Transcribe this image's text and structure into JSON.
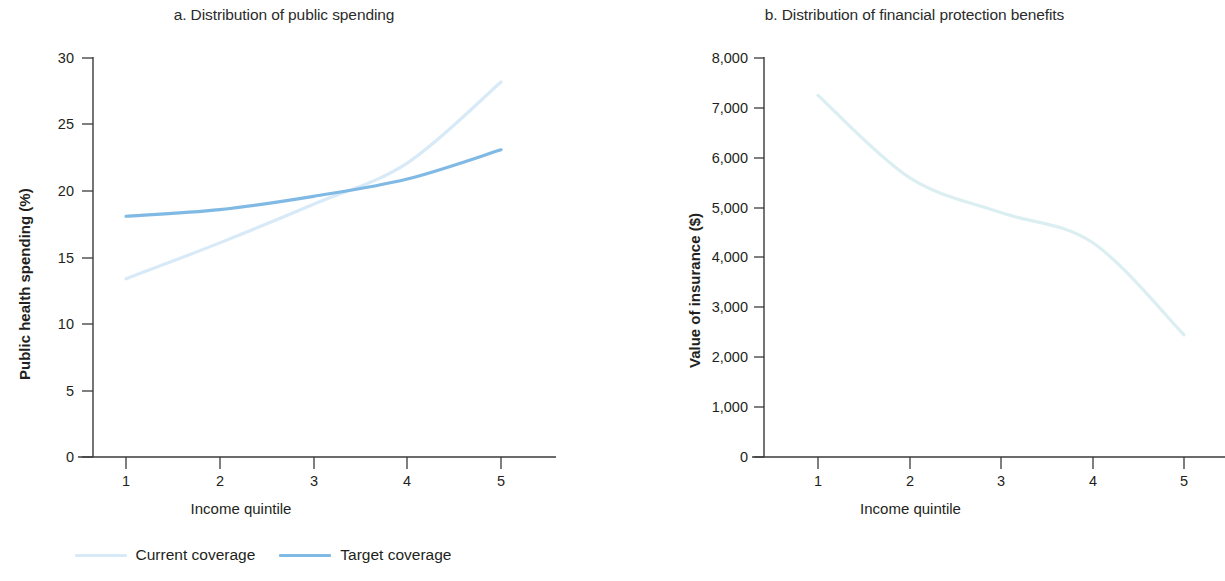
{
  "figure": {
    "background_color": "#ffffff",
    "text_color": "#231f20"
  },
  "panels": [
    {
      "id": "a",
      "title": "a. Distribution of public spending",
      "x_axis_title": "Income quintile",
      "y_axis_title": "Public health spending (%)",
      "x_ticks": [
        "1",
        "2",
        "3",
        "4",
        "5"
      ],
      "y_ticks": [
        "0",
        "5",
        "10",
        "15",
        "20",
        "25",
        "30"
      ]
    },
    {
      "id": "b",
      "title": "b. Distribution of financial protection benefits",
      "x_axis_title": "Income quintile",
      "y_axis_title": "Value of insurance ($)",
      "x_ticks": [
        "1",
        "2",
        "3",
        "4",
        "5"
      ],
      "y_ticks": [
        "0",
        "1,000",
        "2,000",
        "3,000",
        "4,000",
        "5,000",
        "6,000",
        "7,000",
        "8,000"
      ]
    }
  ],
  "legend": {
    "position": "bottom-left-panel",
    "items": [
      {
        "label": "Current coverage",
        "color": "#d8eaf7"
      },
      {
        "label": "Target coverage",
        "color": "#7fb9e4"
      }
    ]
  },
  "chart_data": [
    {
      "type": "line",
      "panel": "a",
      "title": "a. Distribution of public spending",
      "xlabel": "Income quintile",
      "ylabel": "Public health spending (%)",
      "x": [
        1,
        2,
        3,
        4,
        5
      ],
      "xlim": [
        0.55,
        5.45
      ],
      "ylim": [
        0,
        30
      ],
      "xticks": [
        1,
        2,
        3,
        4,
        5
      ],
      "yticks": [
        0,
        5,
        10,
        15,
        20,
        25,
        30
      ],
      "grid": false,
      "legend_position": "below figure, left",
      "series": [
        {
          "name": "Current coverage",
          "color": "#d8eaf7",
          "values": [
            13.4,
            16.1,
            19.0,
            22.1,
            28.2
          ]
        },
        {
          "name": "Target coverage",
          "color": "#7fb9e4",
          "values": [
            18.1,
            18.6,
            19.6,
            20.9,
            23.1
          ]
        }
      ]
    },
    {
      "type": "line",
      "panel": "b",
      "title": "b. Distribution of financial protection benefits",
      "xlabel": "Income quintile",
      "ylabel": "Value of insurance ($)",
      "x": [
        1,
        2,
        3,
        4,
        5
      ],
      "xlim": [
        0.55,
        5.45
      ],
      "ylim": [
        0,
        8000
      ],
      "xticks": [
        1,
        2,
        3,
        4,
        5
      ],
      "yticks": [
        0,
        1000,
        2000,
        3000,
        4000,
        5000,
        6000,
        7000,
        8000
      ],
      "grid": false,
      "legend_position": "none",
      "series": [
        {
          "name": "Current coverage",
          "color": "#dbeef2",
          "values": [
            7250,
            5600,
            4900,
            4300,
            2450
          ]
        }
      ]
    }
  ]
}
